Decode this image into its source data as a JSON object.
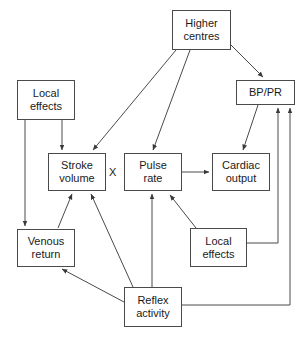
{
  "diagram": {
    "nodes": [
      {
        "id": "higher-centres",
        "label": "Higher\ncentres",
        "x": 172,
        "y": 10,
        "w": 59,
        "h": 40
      },
      {
        "id": "bp-pr",
        "label": "BP/PR",
        "x": 236,
        "y": 80,
        "w": 59,
        "h": 25
      },
      {
        "id": "local-effects-upper",
        "label": "Local\neffects",
        "x": 17,
        "y": 80,
        "w": 58,
        "h": 40
      },
      {
        "id": "stroke-volume",
        "label": "Stroke\nvolume",
        "x": 48,
        "y": 153,
        "w": 58,
        "h": 38
      },
      {
        "id": "pulse-rate",
        "label": "Pulse\nrate",
        "x": 124,
        "y": 153,
        "w": 58,
        "h": 38
      },
      {
        "id": "cardiac-output",
        "label": "Cardiac\noutput",
        "x": 212,
        "y": 153,
        "w": 58,
        "h": 38
      },
      {
        "id": "venous-return",
        "label": "Venous\nreturn",
        "x": 17,
        "y": 229,
        "w": 58,
        "h": 38
      },
      {
        "id": "local-effects-lower",
        "label": "Local\neffects",
        "x": 190,
        "y": 228,
        "w": 57,
        "h": 39
      },
      {
        "id": "reflex-activity",
        "label": "Reflex\nactivity",
        "x": 124,
        "y": 287,
        "w": 58,
        "h": 40
      }
    ],
    "operators": [
      {
        "id": "multiply",
        "label": "X",
        "x": 109,
        "y": 166
      }
    ],
    "edges": [
      {
        "id": "higher-centres-to-stroke-volume",
        "from": "higher-centres",
        "to": "stroke-volume",
        "points": "176,50 93,150"
      },
      {
        "id": "higher-centres-to-pulse-rate",
        "from": "higher-centres",
        "to": "pulse-rate",
        "points": "190,50 153,150"
      },
      {
        "id": "higher-centres-to-bp-pr",
        "from": "higher-centres",
        "to": "bp-pr",
        "points": "231,45 263,77"
      },
      {
        "id": "bp-pr-to-cardiac-output",
        "from": "bp-pr",
        "to": "cardiac-output",
        "points": "258,105 243,150"
      },
      {
        "id": "local-effects-upper-to-stroke-volume",
        "from": "local-effects-upper",
        "to": "stroke-volume",
        "points": "62,120 62,150"
      },
      {
        "id": "local-effects-upper-to-venous-return",
        "from": "local-effects-upper",
        "to": "venous-return",
        "points": "25,120 25,226"
      },
      {
        "id": "venous-return-to-stroke-volume",
        "from": "venous-return",
        "to": "stroke-volume",
        "points": "58,228 72,194"
      },
      {
        "id": "pulse-rate-to-cardiac-output",
        "from": "pulse-rate",
        "to": "cardiac-output",
        "points": "182,172 209,172"
      },
      {
        "id": "reflex-activity-to-stroke-volume",
        "from": "reflex-activity",
        "to": "stroke-volume",
        "points": "133,287 91,194"
      },
      {
        "id": "reflex-activity-to-pulse-rate",
        "from": "reflex-activity",
        "to": "pulse-rate",
        "points": "152,287 152,194"
      },
      {
        "id": "reflex-activity-to-venous-return",
        "from": "reflex-activity",
        "to": "venous-return",
        "points": "124,302 62,269"
      },
      {
        "id": "local-effects-lower-to-pulse-rate",
        "from": "local-effects-lower",
        "to": "pulse-rate",
        "points": "196,228 170,195"
      },
      {
        "id": "local-effects-lower-to-bp-pr",
        "from": "local-effects-lower",
        "to": "bp-pr",
        "points": "247,243 278,243 278,108"
      },
      {
        "id": "reflex-activity-to-bp-pr",
        "from": "reflex-activity",
        "to": "bp-pr",
        "points": "182,305 290,305 290,108"
      }
    ],
    "style": {
      "line_color": "#4a4a4a",
      "box_border_color": "#4a4a4a",
      "background_color": "#ffffff",
      "text_color": "#1a1a1a"
    }
  }
}
